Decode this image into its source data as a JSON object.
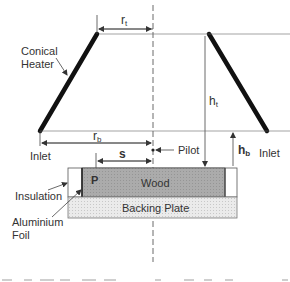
{
  "diagram": {
    "labels": {
      "conical_heater_line1": "Conical",
      "conical_heater_line2": "Heater",
      "r_t": "r",
      "r_t_sub": "t",
      "r_b": "r",
      "r_b_sub": "b",
      "h_t": "h",
      "h_t_sub": "t",
      "h_b": "h",
      "h_b_sub": "b",
      "s": "s",
      "pilot": "Pilot",
      "inlet_left": "Inlet",
      "inlet_right": "Inlet",
      "p": "P",
      "wood": "Wood",
      "backing_plate": "Backing Plate",
      "insulation": "Insulation",
      "aluminium_foil_line1": "Aluminium",
      "aluminium_foil_line2": "Foil"
    },
    "colors": {
      "heater": "#111111",
      "wood_fill": "#a9a9a9",
      "backing_fill": "#e6e6e6",
      "insulation_fill": "#ffffff",
      "line": "#444444",
      "text": "#333333"
    }
  }
}
